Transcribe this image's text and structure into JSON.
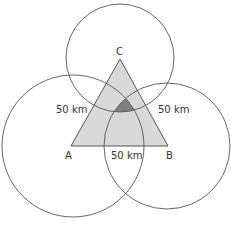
{
  "diagram": {
    "points": {
      "A": {
        "label": "A",
        "x": 71,
        "y": 146
      },
      "B": {
        "label": "B",
        "x": 168,
        "y": 146
      },
      "C": {
        "label": "C",
        "x": 120,
        "y": 59
      }
    },
    "distances": {
      "AC": "50 km",
      "BC": "50 km",
      "AB": "50 km"
    },
    "colors": {
      "triangle_fill": "#d9d9d9",
      "intersection_fill": "#7f7f7f",
      "stroke": "#555555"
    }
  }
}
